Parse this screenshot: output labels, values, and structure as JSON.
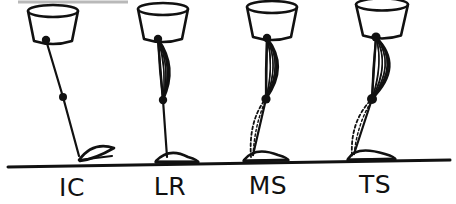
{
  "figure": {
    "background_color": "#ffffff",
    "ink_color": "#111111",
    "ground_line": {
      "name": "ground-line",
      "x1": 8,
      "y1": 167,
      "x2": 450,
      "y2": 160,
      "stroke_width": 3
    },
    "top_artifact": {
      "name": "scan-edge-artifact",
      "x1": 18,
      "y1": 2,
      "x2": 128,
      "y2": 2,
      "color": "#b9b9b9"
    },
    "phases": [
      {
        "id": "ic",
        "label": "IC",
        "full_name": "Initial Contact",
        "label_x": 72,
        "label_y": 196,
        "pelvis": {
          "cx": 53,
          "cy": 26,
          "top_rx": 25,
          "bottom_rx": 19,
          "height": 30,
          "ellipse_ry": 6
        },
        "hip": {
          "x": 46,
          "y": 40,
          "r": 4.2
        },
        "knee": {
          "x": 63,
          "y": 97,
          "r": 4.0
        },
        "ankle": {
          "x": 79,
          "y": 156
        },
        "muscle": {
          "visible": false,
          "bulge": 0
        },
        "calf_dashed": {
          "visible": false
        },
        "foot": {
          "type": "heel-strike",
          "heel_x": 79,
          "heel_y": 160,
          "toe_x": 114,
          "toe_y": 148,
          "tip_x": 112,
          "tip_y": 158
        }
      },
      {
        "id": "lr",
        "label": "LR",
        "full_name": "Loading Response",
        "label_x": 170,
        "label_y": 195,
        "pelvis": {
          "cx": 163,
          "cy": 24,
          "top_rx": 25,
          "bottom_rx": 19,
          "height": 30,
          "ellipse_ry": 6
        },
        "hip": {
          "x": 158,
          "y": 39,
          "r": 4.2
        },
        "knee": {
          "x": 163,
          "y": 100,
          "r": 4.2
        },
        "ankle": {
          "x": 167,
          "y": 157
        },
        "muscle": {
          "visible": true,
          "bulge": 14,
          "lines": 9
        },
        "calf_dashed": {
          "visible": false
        },
        "foot": {
          "type": "flat",
          "heel_x": 156,
          "heel_y": 161,
          "toe_x": 198,
          "toe_y": 160,
          "tip_x": 196,
          "tip_y": 161
        }
      },
      {
        "id": "ms",
        "label": "MS",
        "full_name": "Mid Stance",
        "label_x": 268,
        "label_y": 194,
        "pelvis": {
          "cx": 272,
          "cy": 22,
          "top_rx": 25,
          "bottom_rx": 19,
          "height": 30,
          "ellipse_ry": 6
        },
        "hip": {
          "x": 267,
          "y": 38,
          "r": 4.2
        },
        "knee": {
          "x": 266,
          "y": 99,
          "r": 4.6
        },
        "ankle": {
          "x": 253,
          "y": 155
        },
        "muscle": {
          "visible": true,
          "bulge": 19,
          "lines": 9
        },
        "calf_dashed": {
          "visible": true,
          "width": 11
        },
        "foot": {
          "type": "flat",
          "heel_x": 244,
          "heel_y": 160,
          "toe_x": 288,
          "toe_y": 158,
          "tip_x": 286,
          "tip_y": 159
        }
      },
      {
        "id": "ts",
        "label": "TS",
        "full_name": "Terminal Stance",
        "label_x": 375,
        "label_y": 193,
        "pelvis": {
          "cx": 382,
          "cy": 20,
          "top_rx": 26,
          "bottom_rx": 19,
          "height": 31,
          "ellipse_ry": 6
        },
        "hip": {
          "x": 376,
          "y": 37,
          "r": 4.6
        },
        "knee": {
          "x": 372,
          "y": 99,
          "r": 5.0
        },
        "ankle": {
          "x": 354,
          "y": 154
        },
        "muscle": {
          "visible": true,
          "bulge": 27,
          "lines": 10
        },
        "calf_dashed": {
          "visible": true,
          "width": 13
        },
        "foot": {
          "type": "flat",
          "heel_x": 348,
          "heel_y": 159,
          "toe_x": 395,
          "toe_y": 157,
          "tip_x": 393,
          "tip_y": 158
        }
      }
    ]
  }
}
